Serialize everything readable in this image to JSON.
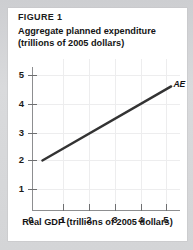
{
  "figure": {
    "label": "FIGURE 1",
    "y_axis_title_line1": "Aggregate planned expenditure",
    "y_axis_title_line2": "(trillions of 2005 dollars)",
    "x_axis_title_bold": "Real GDP",
    "x_axis_title_rest": " (trillions of 2005 dollars)",
    "x_axis_title_full": "Real GDP (trillions of 2005 dollars)",
    "origin_label": "0",
    "series_label": "AE",
    "line_color": "#333333",
    "grid_color": "#ededee",
    "axis_color": "#8d8e90",
    "card_background": "#ffffff",
    "page_background": "#d6d7d9"
  },
  "chart_data": {
    "type": "line",
    "title": "FIGURE 1",
    "subtitle": "Aggregate planned expenditure (trillions of 2005 dollars)",
    "xlabel": "Real GDP (trillions of 2005 dollars)",
    "ylabel": "Aggregate planned expenditure (trillions of 2005 dollars)",
    "xlim": [
      0,
      5.7
    ],
    "ylim": [
      0,
      5.4
    ],
    "xticks": [
      1,
      2,
      3,
      4,
      5
    ],
    "xticklabels": [
      "1",
      "2",
      "3",
      "4",
      "5"
    ],
    "yticks": [
      1,
      2,
      3,
      4,
      5
    ],
    "yticklabels": [
      "1",
      "2",
      "3",
      "4",
      "5"
    ],
    "grid": true,
    "legend": "none",
    "annotations": [
      {
        "text": "AE",
        "x": 5.25,
        "y": 4.7,
        "style": "bold-italic"
      }
    ],
    "series": [
      {
        "name": "AE",
        "label": "AE",
        "color": "#333333",
        "slope": 0.5,
        "intercept": 2.0,
        "x": [
          0.2,
          5.2
        ],
        "y": [
          2.0,
          4.6
        ],
        "points": [
          {
            "x": 0.2,
            "y": 2.0
          },
          {
            "x": 1.0,
            "y": 2.4
          },
          {
            "x": 2.0,
            "y": 2.9
          },
          {
            "x": 3.0,
            "y": 3.4
          },
          {
            "x": 4.0,
            "y": 3.9
          },
          {
            "x": 5.0,
            "y": 4.5
          },
          {
            "x": 5.2,
            "y": 4.6
          }
        ]
      }
    ]
  }
}
